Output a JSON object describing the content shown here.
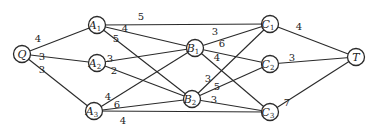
{
  "diagram": {
    "type": "network-graph",
    "nodes": [
      {
        "id": "Q",
        "letter": "Q",
        "sub": "",
        "x": 22,
        "y": 54
      },
      {
        "id": "A1",
        "letter": "A",
        "sub": "1",
        "x": 97,
        "y": 25
      },
      {
        "id": "A2",
        "letter": "A",
        "sub": "2",
        "x": 97,
        "y": 63
      },
      {
        "id": "A3",
        "letter": "A",
        "sub": "3",
        "x": 94,
        "y": 111
      },
      {
        "id": "B1",
        "letter": "B",
        "sub": "1",
        "x": 195,
        "y": 48
      },
      {
        "id": "B2",
        "letter": "B",
        "sub": "2",
        "x": 192,
        "y": 99
      },
      {
        "id": "C1",
        "letter": "C",
        "sub": "1",
        "x": 270,
        "y": 24
      },
      {
        "id": "C2",
        "letter": "C",
        "sub": "2",
        "x": 270,
        "y": 64
      },
      {
        "id": "C3",
        "letter": "C",
        "sub": "3",
        "x": 270,
        "y": 112
      },
      {
        "id": "T",
        "letter": "T",
        "sub": "",
        "x": 356,
        "y": 57
      }
    ],
    "edges": [
      {
        "from": "Q",
        "to": "A1",
        "weight": "4",
        "lx": 38,
        "ly": 42
      },
      {
        "from": "Q",
        "to": "A2",
        "weight": "3",
        "lx": 42,
        "ly": 60
      },
      {
        "from": "Q",
        "to": "A3",
        "weight": "3",
        "lx": 42,
        "ly": 73
      },
      {
        "from": "A1",
        "to": "C1",
        "weight": "5",
        "lx": 141,
        "ly": 20
      },
      {
        "from": "A1",
        "to": "B1",
        "weight": "4",
        "lx": 125,
        "ly": 32
      },
      {
        "from": "A1",
        "to": "B2",
        "weight": "5",
        "lx": 116,
        "ly": 42
      },
      {
        "from": "A2",
        "to": "B1",
        "weight": "3",
        "lx": 110,
        "ly": 62
      },
      {
        "from": "A2",
        "to": "B2",
        "weight": "2",
        "lx": 114,
        "ly": 74
      },
      {
        "from": "A3",
        "to": "B1",
        "weight": "4",
        "lx": 108,
        "ly": 100
      },
      {
        "from": "A3",
        "to": "B2",
        "weight": "6",
        "lx": 117,
        "ly": 108
      },
      {
        "from": "A3",
        "to": "C3",
        "weight": "4",
        "lx": 123,
        "ly": 124
      },
      {
        "from": "B1",
        "to": "C1",
        "weight": "3",
        "lx": 215,
        "ly": 35
      },
      {
        "from": "B1",
        "to": "C2",
        "weight": "6",
        "lx": 222,
        "ly": 47
      },
      {
        "from": "B1",
        "to": "C3",
        "weight": "4",
        "lx": 217,
        "ly": 61
      },
      {
        "from": "B2",
        "to": "C1",
        "weight": "3",
        "lx": 208,
        "ly": 82
      },
      {
        "from": "B2",
        "to": "C2",
        "weight": "5",
        "lx": 217,
        "ly": 90
      },
      {
        "from": "B2",
        "to": "C3",
        "weight": "3",
        "lx": 214,
        "ly": 103
      },
      {
        "from": "C1",
        "to": "T",
        "weight": "4",
        "lx": 299,
        "ly": 30
      },
      {
        "from": "C2",
        "to": "T",
        "weight": "3",
        "lx": 292,
        "ly": 61
      },
      {
        "from": "C3",
        "to": "T",
        "weight": "7",
        "lx": 287,
        "ly": 106
      }
    ]
  }
}
